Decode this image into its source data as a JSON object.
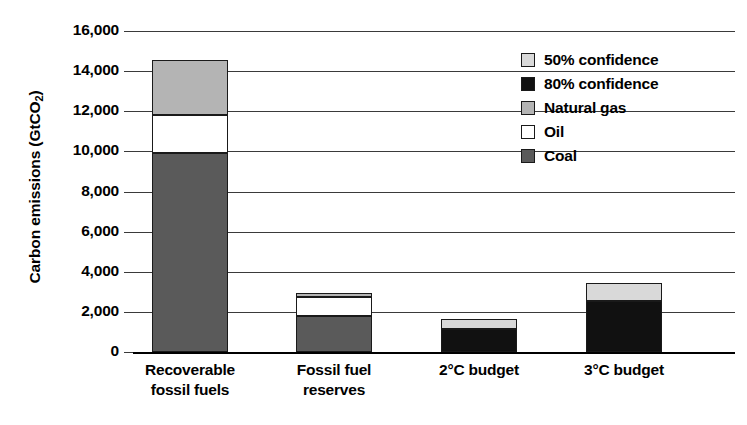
{
  "chart_data": {
    "type": "bar",
    "subtype": "stacked-bar",
    "title": "",
    "xlabel": "",
    "ylabel": "Carbon emissions (GtCO2)",
    "ylabel_display": "Carbon emissions (GtCO",
    "ylabel_sub": "2",
    "ylabel_tail": ")",
    "ylim": [
      0,
      16000
    ],
    "grid": true,
    "grid_axis": "y",
    "legend_position": "upper-right-inside",
    "categories": [
      "Recoverable fossil fuels",
      "Fossil fuel reserves",
      "2°C budget",
      "3°C budget"
    ],
    "category_lines": [
      [
        "Recoverable",
        "fossil fuels"
      ],
      [
        "Fossil fuel",
        "reserves"
      ],
      [
        "2°C budget",
        ""
      ],
      [
        "3°C budget",
        ""
      ]
    ],
    "yticks": [
      0,
      2000,
      4000,
      6000,
      8000,
      10000,
      12000,
      14000,
      16000
    ],
    "ytick_labels": [
      "0",
      "2,000",
      "4,000",
      "6,000",
      "8,000",
      "10,000",
      "12,000",
      "14,000",
      "16,000"
    ],
    "series": [
      {
        "name": "Coal",
        "color": "#5a5a5a",
        "values": [
          9900,
          1790,
          0,
          0
        ]
      },
      {
        "name": "Oil",
        "color": "#ffffff",
        "values": [
          1900,
          940,
          0,
          0
        ]
      },
      {
        "name": "Natural gas",
        "color": "#b4b4b4",
        "values": [
          2750,
          230,
          0,
          0
        ]
      },
      {
        "name": "80% confidence",
        "color": "#111111",
        "values": [
          0,
          0,
          1150,
          2560
        ]
      },
      {
        "name": "50% confidence",
        "color": "#d9d9d9",
        "values": [
          0,
          0,
          520,
          860
        ]
      }
    ],
    "totals": [
      14550,
      2960,
      1670,
      3420
    ],
    "legend_entries": [
      {
        "label": "50% confidence",
        "color": "#d9d9d9"
      },
      {
        "label": "80% confidence",
        "color": "#111111"
      },
      {
        "label": "Natural gas",
        "color": "#b4b4b4"
      },
      {
        "label": "Oil",
        "color": "#ffffff"
      },
      {
        "label": "Coal",
        "color": "#5a5a5a"
      }
    ],
    "stack_order_bottom_to_top": {
      "fuel_bars": [
        "Coal",
        "Oil",
        "Natural gas"
      ],
      "budget_bars": [
        "80% confidence",
        "50% confidence"
      ]
    },
    "bar_stacks": [
      {
        "category": "Recoverable fossil fuels",
        "segments": [
          {
            "name": "Coal",
            "value": 9900,
            "y0": 0,
            "y1": 9900,
            "color": "#5a5a5a"
          },
          {
            "name": "Oil",
            "value": 1900,
            "y0": 9900,
            "y1": 11800,
            "color": "#ffffff"
          },
          {
            "name": "Natural gas",
            "value": 2750,
            "y0": 11800,
            "y1": 14550,
            "color": "#b4b4b4"
          }
        ]
      },
      {
        "category": "Fossil fuel reserves",
        "segments": [
          {
            "name": "Coal",
            "value": 1790,
            "y0": 0,
            "y1": 1790,
            "color": "#5a5a5a"
          },
          {
            "name": "Oil",
            "value": 940,
            "y0": 1790,
            "y1": 2730,
            "color": "#ffffff"
          },
          {
            "name": "Natural gas",
            "value": 230,
            "y0": 2730,
            "y1": 2960,
            "color": "#b4b4b4"
          }
        ]
      },
      {
        "category": "2°C budget",
        "segments": [
          {
            "name": "80% confidence",
            "value": 1150,
            "y0": 0,
            "y1": 1150,
            "color": "#111111"
          },
          {
            "name": "50% confidence",
            "value": 520,
            "y0": 1150,
            "y1": 1670,
            "color": "#d9d9d9"
          }
        ]
      },
      {
        "category": "3°C budget",
        "segments": [
          {
            "name": "80% confidence",
            "value": 2560,
            "y0": 0,
            "y1": 2560,
            "color": "#111111"
          },
          {
            "name": "50% confidence",
            "value": 860,
            "y0": 2560,
            "y1": 3420,
            "color": "#d9d9d9"
          }
        ]
      }
    ]
  }
}
